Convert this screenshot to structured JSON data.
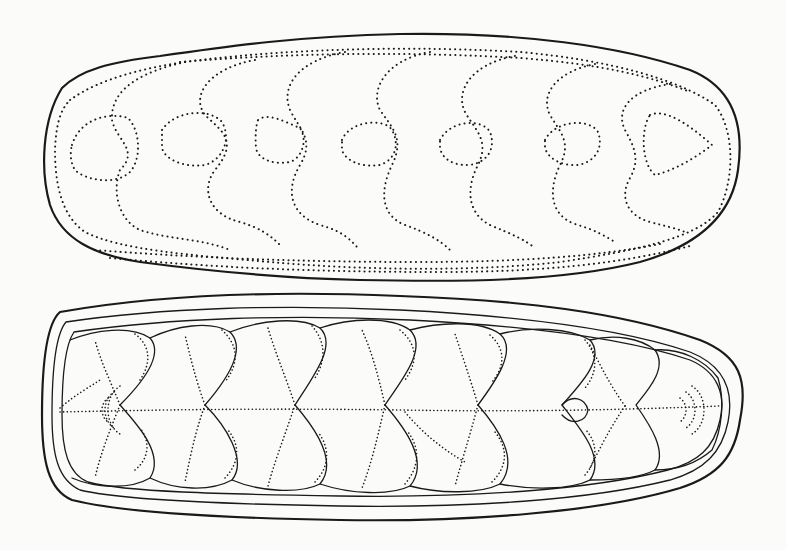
{
  "figure": {
    "background": "#fbfbf9",
    "ink": "#1a1a1a",
    "views": [
      {
        "name": "dorsal-view",
        "description": "Upper view of elongated oval specimen with dotted plate outlines",
        "plates": 8
      },
      {
        "name": "ventral-view",
        "description": "Lower view showing overlapping valves with median dotted line",
        "plates": 8
      }
    ]
  }
}
